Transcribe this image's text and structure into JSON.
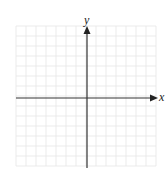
{
  "figure": {
    "type": "blank coordinate plane",
    "x_axis_label": "x",
    "y_axis_label": "y",
    "grid": {
      "columns": 14,
      "rows": 14,
      "left": 16,
      "top": 26,
      "cell_size": 10,
      "line_color": "#e6e6e6"
    },
    "axes": {
      "color": "#333333",
      "origin_px": [
        87,
        98
      ],
      "x_arrow": "right",
      "y_arrow": "up"
    }
  }
}
